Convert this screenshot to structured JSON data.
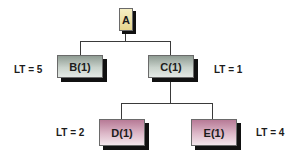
{
  "diagram": {
    "type": "tree",
    "nodes": [
      {
        "id": "A",
        "label": "A",
        "level": 0
      },
      {
        "id": "B",
        "label": "B(1)",
        "level": 1,
        "parent": "A",
        "lead_time": "LT = 5"
      },
      {
        "id": "C",
        "label": "C(1)",
        "level": 1,
        "parent": "A",
        "lead_time": "LT = 1"
      },
      {
        "id": "D",
        "label": "D(1)",
        "level": 2,
        "parent": "C",
        "lead_time": "LT = 2"
      },
      {
        "id": "E",
        "label": "E(1)",
        "level": 2,
        "parent": "C",
        "lead_time": "LT = 4"
      }
    ],
    "colors": {
      "root_fill": "#eee2a8",
      "level1_fill": "#c9d2cb",
      "level2_fill": "#ddb9c9",
      "shadow": "#111111",
      "connector": "#3a3a3a"
    }
  }
}
